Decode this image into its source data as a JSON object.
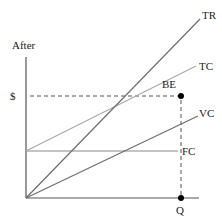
{
  "diagram": {
    "title": "After",
    "y_axis_label": "$",
    "x_axis_label": "Q",
    "break_even_label": "BE",
    "lines": [
      {
        "name": "TR",
        "label": "TR",
        "color": "#6e6e6e",
        "x1": 26,
        "y1": 198,
        "x2": 200,
        "y2": 19
      },
      {
        "name": "TC",
        "label": "TC",
        "color": "#a8a8a8",
        "x1": 26,
        "y1": 151,
        "x2": 196,
        "y2": 66
      },
      {
        "name": "VC",
        "label": "VC",
        "color": "#6e6e6e",
        "x1": 26,
        "y1": 198,
        "x2": 198,
        "y2": 116
      },
      {
        "name": "FC",
        "label": "FC",
        "color": "#8a8a8a",
        "x1": 26,
        "y1": 151,
        "x2": 178,
        "y2": 151
      }
    ],
    "colors": {
      "axis": "#555555",
      "dashed": "#555555",
      "point": "#000000",
      "text": "#222222"
    }
  }
}
